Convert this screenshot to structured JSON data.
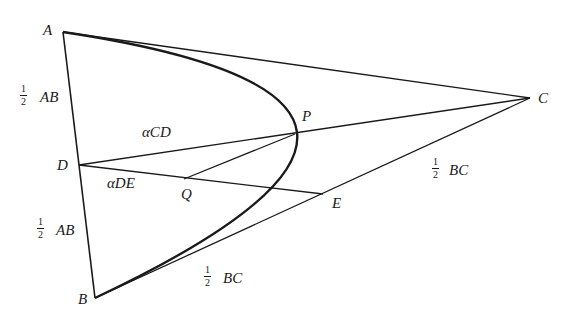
{
  "diagram": {
    "points": {
      "A": {
        "label": "A",
        "x": 63,
        "y": 32
      },
      "B": {
        "label": "B",
        "x": 95,
        "y": 298
      },
      "C": {
        "label": "C",
        "x": 530,
        "y": 98
      },
      "D": {
        "label": "D",
        "x": 79,
        "y": 165
      },
      "E": {
        "label": "E",
        "x": 323,
        "y": 194
      },
      "P": {
        "label": "P",
        "x": 295,
        "y": 134
      },
      "Q": {
        "label": "Q",
        "x": 184,
        "y": 179
      }
    },
    "segments": [
      "AB",
      "AC",
      "BC",
      "DC",
      "DE",
      "QP"
    ],
    "curve": {
      "type": "parabola",
      "from": "A",
      "through": "P",
      "to": "B"
    },
    "labels": {
      "half_ab_upper": {
        "fraction_num": "1",
        "fraction_den": "2",
        "text": "AB"
      },
      "half_ab_lower": {
        "fraction_num": "1",
        "fraction_den": "2",
        "text": "AB"
      },
      "half_bc_upper": {
        "fraction_num": "1",
        "fraction_den": "2",
        "text": "BC"
      },
      "half_bc_lower": {
        "fraction_num": "1",
        "fraction_den": "2",
        "text": "BC"
      },
      "alpha_cd": "αCD",
      "alpha_de": "αDE"
    },
    "colors": {
      "stroke": "#1a1a1a",
      "background": "#ffffff"
    }
  }
}
